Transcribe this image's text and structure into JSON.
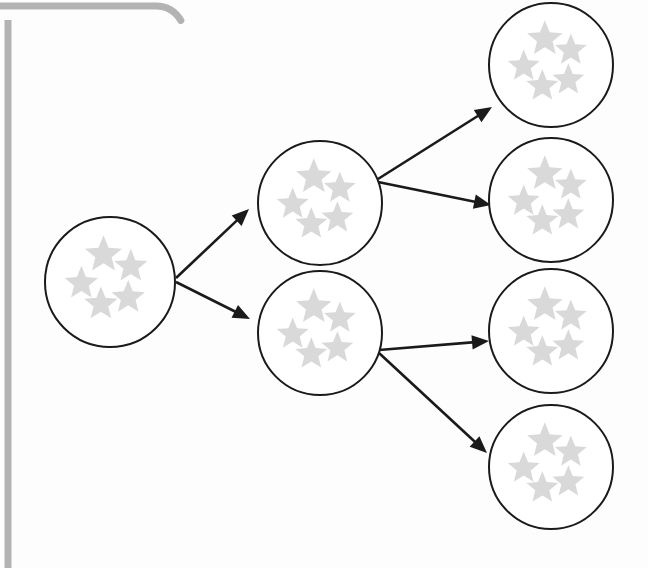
{
  "canvas": {
    "width": 648,
    "height": 568,
    "background_color": "#fdfdfd",
    "title": "Star cluster branching diagram"
  },
  "frame": {
    "name": "panel-border-fragment",
    "stroke_color": "#b3b3b3",
    "stroke_width": 7,
    "corner_radius": 16,
    "description": "Light gray rounded panel edge fragment at top-left, horizontal bar across top and vertical bar down left side",
    "vertical_line": {
      "x": 8,
      "y1": 20,
      "y2": 568
    },
    "horizontal_line": {
      "y": 6,
      "x1": 0,
      "x2": 172
    },
    "corner": {
      "cx": 172,
      "cy": 6
    }
  },
  "nodes": {
    "circle_stroke_color": "#1a1a1a",
    "circle_stroke_width": 2,
    "circle_fill_color": "#ffffff",
    "star_fill_color": "#d9d9d9",
    "stars_per_node": 5,
    "star_layout": [
      {
        "dx": -0.1,
        "dy": -0.42,
        "r": 0.3,
        "rot": 0
      },
      {
        "dx": 0.32,
        "dy": -0.24,
        "r": 0.27,
        "rot": 0
      },
      {
        "dx": -0.44,
        "dy": 0.02,
        "r": 0.27,
        "rot": 0
      },
      {
        "dx": -0.14,
        "dy": 0.34,
        "r": 0.27,
        "rot": 0
      },
      {
        "dx": 0.28,
        "dy": 0.24,
        "r": 0.27,
        "rot": 0
      }
    ],
    "items": [
      {
        "id": "root",
        "label": "root-cluster",
        "cx": 110,
        "cy": 282,
        "r": 65,
        "column": 1,
        "star_count": 5
      },
      {
        "id": "mid-top",
        "label": "middle-cluster-top",
        "cx": 320,
        "cy": 203,
        "r": 62,
        "column": 2,
        "star_count": 5
      },
      {
        "id": "mid-bottom",
        "label": "middle-cluster-bottom",
        "cx": 320,
        "cy": 333,
        "r": 62,
        "column": 2,
        "star_count": 5
      },
      {
        "id": "leaf-1",
        "label": "leaf-cluster-1",
        "cx": 551,
        "cy": 65,
        "r": 62,
        "column": 3,
        "star_count": 5
      },
      {
        "id": "leaf-2",
        "label": "leaf-cluster-2",
        "cx": 551,
        "cy": 200,
        "r": 62,
        "column": 3,
        "star_count": 5
      },
      {
        "id": "leaf-3",
        "label": "leaf-cluster-3",
        "cx": 551,
        "cy": 331,
        "r": 62,
        "column": 3,
        "star_count": 5
      },
      {
        "id": "leaf-4",
        "label": "leaf-cluster-4",
        "cx": 551,
        "cy": 467,
        "r": 62,
        "column": 3,
        "star_count": 5
      }
    ]
  },
  "edges": {
    "stroke_color": "#1a1a1a",
    "stroke_width": 2.6,
    "arrowhead_color": "#1a1a1a",
    "items": [
      {
        "id": "e1",
        "label": "root-to-middle-top",
        "from": "root",
        "to": "mid-top",
        "x1": 176,
        "y1": 278,
        "x2": 249,
        "y2": 209
      },
      {
        "id": "e2",
        "label": "root-to-middle-bottom",
        "from": "root",
        "to": "mid-bottom",
        "x1": 176,
        "y1": 282,
        "x2": 250,
        "y2": 319
      },
      {
        "id": "e3",
        "label": "middle-top-to-leaf-1",
        "from": "mid-top",
        "to": "leaf-1",
        "x1": 378,
        "y1": 179,
        "x2": 492,
        "y2": 107
      },
      {
        "id": "e4",
        "label": "middle-top-to-leaf-2",
        "from": "mid-top",
        "to": "leaf-2",
        "x1": 378,
        "y1": 182,
        "x2": 491,
        "y2": 205
      },
      {
        "id": "e5",
        "label": "middle-bottom-to-leaf-3",
        "from": "mid-bottom",
        "to": "leaf-3",
        "x1": 379,
        "y1": 350,
        "x2": 489,
        "y2": 341
      },
      {
        "id": "e6",
        "label": "middle-bottom-to-leaf-4",
        "from": "mid-bottom",
        "to": "leaf-4",
        "x1": 379,
        "y1": 353,
        "x2": 487,
        "y2": 453
      }
    ]
  }
}
